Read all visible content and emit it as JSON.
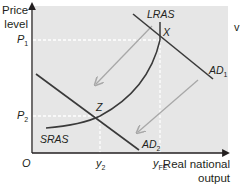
{
  "diagram": {
    "type": "economics AD/AS diagram",
    "y_axis": {
      "title_line1": "Price",
      "title_line2": "level"
    },
    "x_axis": {
      "title_line1": "Real national",
      "title_line2": "output"
    },
    "origin": "O",
    "y_ticks": [
      {
        "main": "P",
        "sub": "1"
      },
      {
        "main": "P",
        "sub": "2"
      }
    ],
    "x_ticks": [
      {
        "main": "y",
        "sub": "2"
      },
      {
        "main": "y",
        "sub": "FE"
      }
    ],
    "curves": {
      "lras": "LRAS",
      "sras": "SRAS",
      "ad1": {
        "main": "AD",
        "sub": "1"
      },
      "ad2": {
        "main": "AD",
        "sub": "2"
      }
    },
    "points": {
      "x": "X",
      "z": "Z"
    },
    "edge_fragment": "v",
    "colors": {
      "plot_bg": "#e6e6e6",
      "curve": "#3a3a3a",
      "arrow": "#a8a8a8",
      "dashed": "#ffffff",
      "axis": "#231f20"
    }
  }
}
